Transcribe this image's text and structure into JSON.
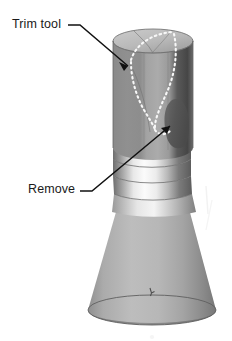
{
  "figure": {
    "kind": "cad-3d-model-figure",
    "background_color": "#ffffff",
    "annotations": [
      {
        "id": "trim-tool",
        "label": "Trim tool",
        "leader": "horizontal dash then diagonal arrow down-right",
        "target": "dotted trim curve on cylinder top edge"
      },
      {
        "id": "remove",
        "label": "Remove",
        "leader": "horizontal dash then long diagonal arrow up-right",
        "target": "dark teardrop region to be cut away"
      }
    ],
    "colors": {
      "ink": "#1a1a1a",
      "cylinder_left_face": "#8c8c8c",
      "cylinder_mid_face": "#a9a9a9",
      "cylinder_right_dark_band": "#4c4c4c",
      "top_cap_face": "#bfbfbf",
      "remove_lobe": "#555555",
      "groove_highlight": "#f2f2f2",
      "groove_shadow": "#6e6e6e",
      "cone_face": "#b3b3b3",
      "cone_shadow": "#767676",
      "dotted_curve": "#f5f5f5",
      "seam_line": "#5a5a5a"
    },
    "geometry": {
      "top_cap_center_x": 153,
      "top_cap_center_y": 41,
      "top_cap_rx": 40,
      "top_cap_ry": 12,
      "cylinder_bottom_y": 150,
      "groove_count": 4,
      "cone_base_center_y": 312,
      "cone_base_rx": 64,
      "cone_base_ry": 15
    }
  }
}
